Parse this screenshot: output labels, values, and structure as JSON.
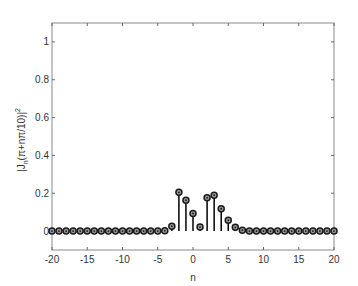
{
  "chart_data": {
    "type": "stem",
    "title": "",
    "xlabel": "n",
    "ylabel": "|J_n(π+nπ/10)|²",
    "ylabel_parts": {
      "pre": "|J",
      "sub": "n",
      "mid": "(π+nπ/10)|",
      "sup": "2"
    },
    "xlim": [
      -20,
      20
    ],
    "ylim": [
      -0.1,
      1.1
    ],
    "xticks": [
      -20,
      -15,
      -10,
      -5,
      0,
      5,
      10,
      15,
      20
    ],
    "xtick_labels": [
      "-20",
      "-15",
      "-10",
      "-5",
      "0",
      "5",
      "10",
      "15",
      "20"
    ],
    "yticks": [
      0,
      0.2,
      0.4,
      0.6,
      0.8,
      1
    ],
    "ytick_labels": [
      "0",
      "0.2",
      "0.4",
      "0.6",
      "0.8",
      "1"
    ],
    "grid": false,
    "legend": null,
    "x": [
      -20,
      -19,
      -18,
      -17,
      -16,
      -15,
      -14,
      -13,
      -12,
      -11,
      -10,
      -9,
      -8,
      -7,
      -6,
      -5,
      -4,
      -3,
      -2,
      -1,
      0,
      1,
      2,
      3,
      4,
      5,
      6,
      7,
      8,
      9,
      10,
      11,
      12,
      13,
      14,
      15,
      16,
      17,
      18,
      19,
      20
    ],
    "values": [
      0,
      0,
      0,
      0,
      0,
      0,
      0,
      0,
      0,
      0,
      0,
      0,
      0,
      0,
      0,
      0,
      0.002,
      0.026,
      0.205,
      0.163,
      0.093,
      0.021,
      0.176,
      0.19,
      0.118,
      0.057,
      0.02,
      0.005,
      0,
      0,
      0,
      0,
      0,
      0,
      0,
      0,
      0,
      0,
      0,
      0,
      0
    ],
    "marker": "circle-dot",
    "colors": {
      "stem": "#000000",
      "marker_edge": "#1a1a1a",
      "marker_fill": "#9a9a9a",
      "axes": "#666666"
    }
  }
}
